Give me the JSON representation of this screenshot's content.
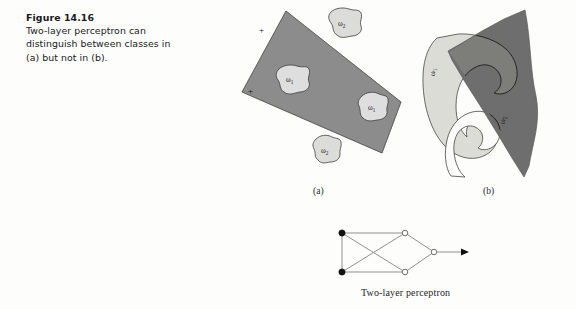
{
  "figure": {
    "number_label": "Figure 14.16",
    "caption_text": "Two-layer perceptron can distinguish between classes in (a) but not in (b)."
  },
  "subfigures": {
    "a": {
      "label": "(a)",
      "region_name": "decision-region-quadrilateral",
      "fill_color": "#8c8c8c",
      "plus_markers": [
        "+",
        "+"
      ],
      "class_blobs": [
        {
          "label": "ω",
          "subscript": "1",
          "inside_region": true,
          "position": "left-center"
        },
        {
          "label": "ω",
          "subscript": "1",
          "inside_region": true,
          "position": "right-lower"
        },
        {
          "label": "ω",
          "subscript": "2",
          "inside_region": false,
          "position": "top-right"
        },
        {
          "label": "ω",
          "subscript": "2",
          "inside_region": false,
          "position": "bottom-center"
        }
      ]
    },
    "b": {
      "label": "(b)",
      "region_name": "decision-region-wedge",
      "fill_color": "#6e6e6e",
      "class_blobs": [
        {
          "label": "ω",
          "subscript": "1",
          "inside_region": false,
          "position": "left-arc"
        },
        {
          "label": "ω",
          "subscript": "2",
          "inside_region": true,
          "position": "inner-arc"
        }
      ]
    }
  },
  "network": {
    "caption": "Two-layer perceptron",
    "input_nodes": 2,
    "hidden_nodes": 2,
    "output_nodes": 1,
    "input_node_style": "filled",
    "hidden_node_style": "hollow",
    "output_node_style": "hollow",
    "has_output_arrow": true,
    "edge_color": "#8a8a8a",
    "node_fill_dark": "#111111",
    "node_fill_light": "#ffffff"
  },
  "colors": {
    "page_background": "#fdfdfc",
    "text": "#1a1a1a",
    "region_a_gray": "#8c8c8c",
    "region_b_gray": "#6e6e6e",
    "blob_light": "#dcdcd8",
    "blob_pale": "#d2d2cd",
    "outline": "#4a4a4a"
  }
}
